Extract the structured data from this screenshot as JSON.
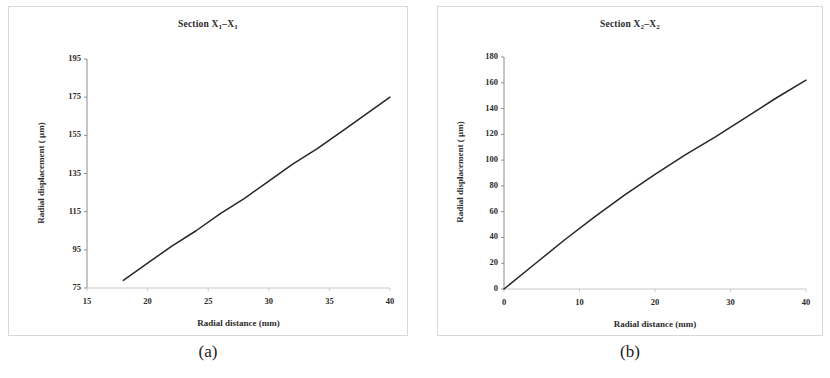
{
  "figure": {
    "panels": [
      {
        "caption": "(a)",
        "title_prefix": "Section X",
        "title_sub1": "1",
        "title_mid": "–X",
        "title_sub2": "1"
      },
      {
        "caption": "(b)",
        "title_prefix": "Section X",
        "title_sub1": "2",
        "title_mid": "–X",
        "title_sub2": "2"
      }
    ]
  },
  "chart_data": [
    {
      "type": "line",
      "title": "Section X1–X1",
      "xlabel": "Radial distance (mm)",
      "ylabel": "Radial displacement ( µm)",
      "xlim": [
        15,
        40
      ],
      "ylim": [
        75,
        195
      ],
      "xticks": [
        15,
        20,
        25,
        30,
        35,
        40
      ],
      "yticks": [
        75,
        95,
        115,
        135,
        155,
        175,
        195
      ],
      "grid": false,
      "legend": null,
      "series": [
        {
          "name": "Radial displacement",
          "x": [
            18,
            20,
            22,
            24,
            26,
            28,
            30,
            32,
            34,
            36,
            38,
            40
          ],
          "values": [
            79,
            88,
            97,
            105,
            114,
            122,
            131,
            140,
            148,
            157,
            166,
            175
          ]
        }
      ]
    },
    {
      "type": "line",
      "title": "Section X2–X2",
      "xlabel": "Radial distance (mm)",
      "ylabel": "Radial displacement ( µm)",
      "xlim": [
        0,
        40
      ],
      "ylim": [
        0,
        180
      ],
      "xticks": [
        0,
        10,
        20,
        30,
        40
      ],
      "yticks": [
        0,
        20,
        40,
        60,
        80,
        100,
        120,
        140,
        160,
        180
      ],
      "grid": false,
      "legend": null,
      "series": [
        {
          "name": "Radial displacement",
          "x": [
            0,
            4,
            8,
            12,
            16,
            20,
            24,
            28,
            32,
            36,
            40
          ],
          "values": [
            0,
            19,
            38,
            56,
            73,
            89,
            104,
            118,
            133,
            148,
            162
          ]
        }
      ]
    }
  ],
  "style": {
    "line_color": "#262626",
    "axis_color": "#8c8c8c",
    "text_color": "#2b2b2b",
    "panel_border": "#d8d8d8",
    "background": "#ffffff"
  }
}
